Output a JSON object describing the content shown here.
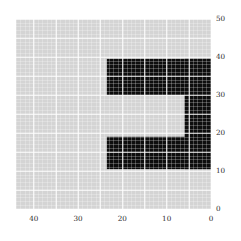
{
  "chart_data": {
    "type": "heatmap",
    "title": "",
    "xlabel": "",
    "ylabel": "",
    "xlim": [
      44,
      0
    ],
    "ylim": [
      0,
      50
    ],
    "x_ticks": [
      40,
      30,
      20,
      10,
      0
    ],
    "y_ticks": [
      50,
      40,
      30,
      20,
      10,
      0
    ],
    "x_axis_inverted": true,
    "grid": true,
    "grid_color": "#ffffff",
    "cell_size": 1,
    "background_value": 0,
    "foreground_value": 1,
    "colors": {
      "background_cell": "#d4d4d4",
      "foreground_cell": "#0d0d0d",
      "gridline": "#ffffff",
      "figure_background": "#ffffff",
      "tick_text": "#2b2b2b"
    },
    "legend": null,
    "annotations": [],
    "shape_description": "bracket-shaped filled region opening toward the left (low x side at right edge)",
    "filled_regions": [
      {
        "name": "top-bar",
        "x_start": 23.5,
        "x_end": 0,
        "y_start": 39.5,
        "y_end": 30.0
      },
      {
        "name": "right-column",
        "x_start": 6.0,
        "x_end": 0,
        "y_start": 39.5,
        "y_end": 10.5
      },
      {
        "name": "bottom-bar",
        "x_start": 23.5,
        "x_end": 0,
        "y_start": 19.0,
        "y_end": 10.5
      }
    ]
  },
  "axes": {
    "y_tick_labels": [
      "50",
      "40",
      "30",
      "20",
      "10",
      "0"
    ],
    "y_tick_values": [
      50,
      40,
      30,
      20,
      10,
      0
    ],
    "x_tick_labels": [
      "40",
      "30",
      "20",
      "10",
      "0"
    ],
    "x_tick_values": [
      40,
      30,
      20,
      10,
      0
    ]
  }
}
